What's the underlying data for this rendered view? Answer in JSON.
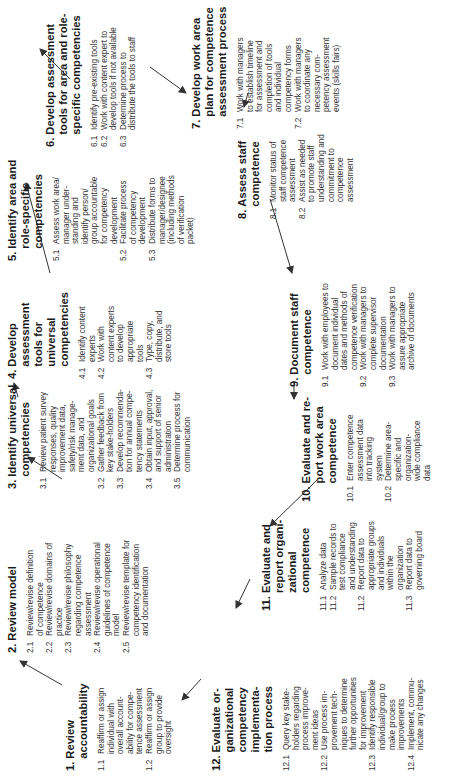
{
  "diagram": {
    "orientation": "rotated 90 degrees counter-clockwise",
    "steps": [
      {
        "num": "1.",
        "title": "Review\naccountability",
        "items": [
          {
            "num": "1.1",
            "text": "Reaffirm or assign\nindividual with\noverall account-\nability for compe-\ntence assessment"
          },
          {
            "num": "1.2",
            "text": "Reaffirm or assign\ngroup to provide\noversight"
          }
        ]
      },
      {
        "num": "2.",
        "title": "Review model",
        "items": [
          {
            "num": "2.1",
            "text": "Review/revise definition\nof competence"
          },
          {
            "num": "2.2",
            "text": "Review/revise domains of\npractice"
          },
          {
            "num": "2.3",
            "text": "Review/revise philosophy\nregarding competence\nassessment"
          },
          {
            "num": "2.4",
            "text": "Review/revise operational\nguidelines of competence\nmodel"
          },
          {
            "num": "2.5",
            "text": "Review/revise template for\ncompetency identification\nand documentation"
          }
        ]
      },
      {
        "num": "3.",
        "title": "Identify universal\ncompetencies",
        "items": [
          {
            "num": "3.1",
            "text": "Review patient survey\nresponses, quality\nimprovement data,\nsafety/risk manage-\nment data, and\norganizational goals"
          },
          {
            "num": "3.2",
            "text": "Gather feedback from\nkey stake-holders"
          },
          {
            "num": "3.3",
            "text": "Develop recommenda-\ntion for annual compe-\ntency statements"
          },
          {
            "num": "3.4",
            "text": "Obtain input, approval,\nand support of senior\nadministration"
          },
          {
            "num": "3.5",
            "text": "Determine process for\ncommunication"
          }
        ]
      },
      {
        "num": "4.",
        "title": "Develop\nassessment\ntools for\nuniversal\ncompetencies",
        "items": [
          {
            "num": "4.1",
            "text": "Identify content\nexperts"
          },
          {
            "num": "4.2",
            "text": "Work with\ncontent experts\nto develop\nappropriate\ntools"
          },
          {
            "num": "4.3",
            "text": "Type, copy,\ndistribute, and\nstore tools"
          }
        ]
      },
      {
        "num": "5.",
        "title": "Identify area and\nrole-specific\ncompetencies",
        "items": [
          {
            "num": "5.1",
            "text": "Assess work area/\nmanager under-\nstanding and\nidentify person/\ngroup accountable\nfor competency\ndevelopment"
          },
          {
            "num": "5.2",
            "text": "Facilitate process\nof competency\ndevelopment"
          },
          {
            "num": "5.3",
            "text": "Distribute forms to\nmanager/designee\n(including methods\nof verification\npacket)"
          }
        ]
      },
      {
        "num": "6.",
        "title": "Develop assessment\ntools for area and role-\nspecific competencies",
        "items": [
          {
            "num": "6.1",
            "text": "Identify pre-existing tools"
          },
          {
            "num": "6.2",
            "text": "Work with content expert to\ndevelop tools if not available"
          },
          {
            "num": "6.3",
            "text": "Determine process to\ndistribute the tools to staff"
          }
        ]
      },
      {
        "num": "7.",
        "title": "Develop work area\nplan for competence\nassessment process",
        "items": [
          {
            "num": "7.1",
            "text": "Work with managers\nto establish timeline\nfor assessment and\ncompletion of tools\nand individual\ncompetency forms"
          },
          {
            "num": "7.2",
            "text": "Work with managers\nto coordinate any\nnecessary com-\npetency assessment\nevents (skills fairs)"
          }
        ]
      },
      {
        "num": "8.",
        "title": "Assess staff\ncompetence",
        "items": [
          {
            "num": "8.1",
            "text": "Monitor status of\nstaff competence\nassessment"
          },
          {
            "num": "8.2",
            "text": "Assist as needed\nto promote staff\nunderstanding and\ncommitment to\ncompetence\nassessment"
          }
        ]
      },
      {
        "num": "9.",
        "title": "Document staff\ncompetence",
        "items": [
          {
            "num": "9.1",
            "text": "Work with employees to\ndocument individual\ndates and methods of\ncompetence verification"
          },
          {
            "num": "9.2",
            "text": "Work with managers to\ncomplete supervisor\ndocumentation"
          },
          {
            "num": "9.3",
            "text": "Work with managers to\nassure appropriate\narchive of documents"
          }
        ]
      },
      {
        "num": "10.",
        "title": "Evaluate and re-\nport work area\ncompetence",
        "items": [
          {
            "num": "10.1",
            "text": "Enter competence\nassessment data\ninto tracking\nsystem"
          },
          {
            "num": "10.2",
            "text": "Determine area-\nspecific and\norganization-\nwide compliance\ndata"
          }
        ]
      },
      {
        "num": "11.",
        "title": "Evaluate and\nreport organi-\nzational\ncompetence",
        "items": [
          {
            "num": "11.1",
            "text": "Analyze data"
          },
          {
            "num": "11.2",
            "text": "Sample records to\ntest compliance\nand understanding"
          },
          {
            "num": "11.2",
            "text": "Report data to\nappropriate groups\nand individuals\nwithin the\norganization"
          },
          {
            "num": "11.3",
            "text": "Report data to\ngoverning board"
          }
        ]
      },
      {
        "num": "12.",
        "title": "Evaluate or-\nganizational\ncompetency\nimplementa-\ntion process",
        "items": [
          {
            "num": "12.1",
            "text": "Query key stake-\nholders regarding\nprocess improve-\nment ideas"
          },
          {
            "num": "12.2",
            "text": "Use process im-\nprovement tech-\nniques to determine\nfurther opportunities\nfor improvement"
          },
          {
            "num": "12.3",
            "text": "Identify responsible\nindividual/group to\nmake process\nimprovements"
          },
          {
            "num": "12.4",
            "text": "Implement, commu-\nnicate any changes"
          }
        ]
      }
    ],
    "colors": {
      "background": "#ffffff",
      "text": "#222222",
      "arrow": "#333333"
    }
  }
}
